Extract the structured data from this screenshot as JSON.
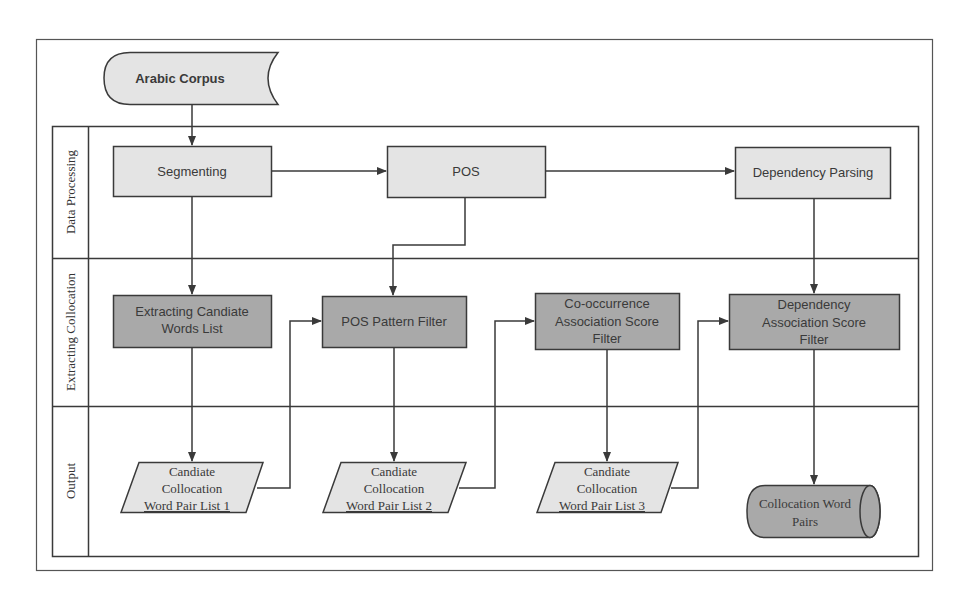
{
  "diagram": {
    "type": "swimlane-flowchart",
    "colors": {
      "stroke": "#3a3a3a",
      "light_fill": "#e4e4e4",
      "dark_fill": "#a9a9a9",
      "background": "#ffffff"
    },
    "source": {
      "id": "arabic-corpus",
      "label": "Arabic Corpus"
    },
    "lanes": [
      {
        "id": "data-processing",
        "label": "Data Processing"
      },
      {
        "id": "extracting-collocation",
        "label": "Extracting Collocation"
      },
      {
        "id": "output",
        "label": "Output"
      }
    ],
    "nodes": {
      "segmenting": {
        "label": "Segmenting",
        "lane": "data-processing"
      },
      "pos": {
        "label": "POS",
        "lane": "data-processing"
      },
      "dependency_parsing": {
        "label": "Dependency Parsing",
        "lane": "data-processing"
      },
      "extracting_candidate": {
        "lines": [
          "Extracting Candiate",
          "Words List"
        ],
        "lane": "extracting-collocation"
      },
      "pos_pattern_filter": {
        "label": "POS Pattern Filter",
        "lane": "extracting-collocation"
      },
      "cooccurrence_filter": {
        "lines": [
          "Co-occurrence",
          "Association Score",
          "Filter"
        ],
        "lane": "extracting-collocation"
      },
      "dependency_filter": {
        "lines": [
          "Dependency",
          "Association Score",
          "Filter"
        ],
        "lane": "extracting-collocation"
      },
      "list1": {
        "lines": [
          "Candiate",
          "Collocation",
          "Word Pair List 1"
        ],
        "lane": "output"
      },
      "list2": {
        "lines": [
          "Candiate",
          "Collocation",
          "Word Pair List 2"
        ],
        "lane": "output"
      },
      "list3": {
        "lines": [
          "Candiate",
          "Collocation",
          "Word Pair List 3"
        ],
        "lane": "output"
      },
      "final": {
        "lines": [
          "Collocation Word",
          "Pairs"
        ],
        "lane": "output"
      }
    },
    "edges": [
      [
        "arabic-corpus",
        "segmenting"
      ],
      [
        "segmenting",
        "pos"
      ],
      [
        "pos",
        "dependency_parsing"
      ],
      [
        "segmenting",
        "extracting_candidate"
      ],
      [
        "pos",
        "pos_pattern_filter"
      ],
      [
        "dependency_parsing",
        "dependency_filter"
      ],
      [
        "extracting_candidate",
        "list1"
      ],
      [
        "list1",
        "pos_pattern_filter"
      ],
      [
        "pos_pattern_filter",
        "list2"
      ],
      [
        "list2",
        "cooccurrence_filter"
      ],
      [
        "cooccurrence_filter",
        "list3"
      ],
      [
        "list3",
        "dependency_filter"
      ],
      [
        "dependency_filter",
        "final"
      ]
    ]
  }
}
